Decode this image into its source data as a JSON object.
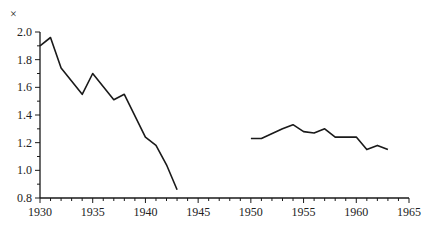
{
  "chart_data": {
    "type": "line",
    "title": "",
    "xlabel": "",
    "ylabel": "×",
    "xlim": [
      1930,
      1965
    ],
    "ylim": [
      0.8,
      2.0
    ],
    "x_ticks": [
      "1930",
      "1935",
      "1940",
      "1945",
      "1950",
      "1955",
      "1960",
      "1965"
    ],
    "y_ticks": [
      "0.8",
      "1.0",
      "1.2",
      "1.4",
      "1.6",
      "1.8",
      "2.0"
    ],
    "grid": false,
    "legend": null,
    "series": [
      {
        "name": "segment-1",
        "x": [
          1930,
          1931,
          1932,
          1934,
          1935,
          1937,
          1938,
          1940,
          1941,
          1942,
          1943
        ],
        "values": [
          1.9,
          1.96,
          1.74,
          1.55,
          1.7,
          1.51,
          1.55,
          1.24,
          1.18,
          1.04,
          0.86
        ]
      },
      {
        "name": "segment-2",
        "x": [
          1950,
          1951,
          1953,
          1954,
          1955,
          1956,
          1957,
          1958,
          1959,
          1960,
          1961,
          1962,
          1963
        ],
        "values": [
          1.23,
          1.23,
          1.3,
          1.33,
          1.28,
          1.27,
          1.3,
          1.24,
          1.24,
          1.24,
          1.15,
          1.18,
          1.15
        ]
      }
    ]
  },
  "labels": {
    "y_unit": "×"
  },
  "colors": {
    "line": "#1a1a1a",
    "axis": "#1a1a1a"
  }
}
